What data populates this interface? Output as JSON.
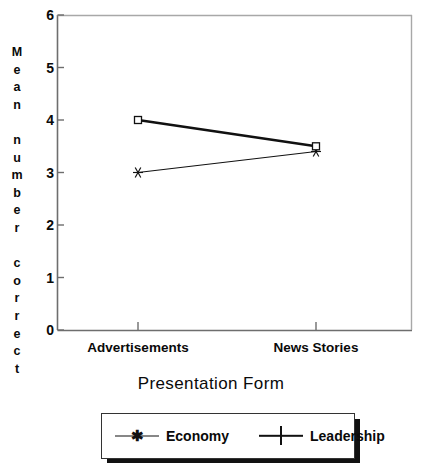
{
  "chart_data": {
    "type": "line",
    "title": "",
    "xlabel": "Presentation Form",
    "ylabel": "Mean number correct",
    "categories": [
      "Advertisements",
      "News Stories"
    ],
    "ylim": [
      0,
      6
    ],
    "yticks": [
      0,
      1,
      2,
      3,
      4,
      5,
      6
    ],
    "grid": false,
    "legend_position": "bottom",
    "series": [
      {
        "name": "Economy",
        "values": [
          3.0,
          3.4
        ],
        "marker": "asterisk",
        "line": "thin"
      },
      {
        "name": "Leadership",
        "values": [
          4.0,
          3.5
        ],
        "marker": "square",
        "line": "thick"
      }
    ]
  },
  "axes": {
    "ylabel_chars": [
      "M",
      "e",
      "a",
      "n",
      "",
      "n",
      "u",
      "m",
      "b",
      "e",
      "r",
      "",
      "c",
      "o",
      "r",
      "r",
      "e",
      "c",
      "t"
    ],
    "ytick_labels": [
      "6",
      "5",
      "4",
      "3",
      "2",
      "1",
      "0"
    ],
    "xtick_labels": [
      "Advertisements",
      "News Stories"
    ],
    "xtitle": "Presentation Form"
  },
  "legend": {
    "entries": [
      {
        "label": "Economy",
        "marker": "asterisk-marker",
        "glyph": "✱"
      },
      {
        "label": "Leadership",
        "marker": "square-marker",
        "glyph": ""
      }
    ]
  },
  "colors": {
    "ink": "#111111",
    "axis": "#6e6e6e",
    "background": "#ffffff",
    "shadow": "#111111"
  }
}
